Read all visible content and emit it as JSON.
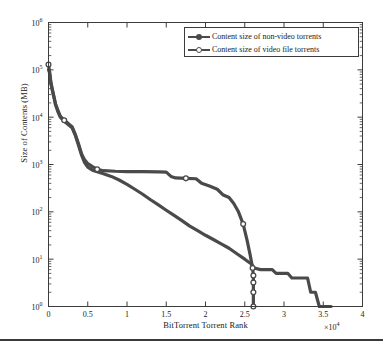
{
  "figure": {
    "background": "#ffffff",
    "line_color": "#4a4a4a",
    "axis_color": "#3c3c3c"
  },
  "legend": {
    "position": "top-right-inside",
    "entries": [
      {
        "label": "Content size of non-video torrents",
        "marker": "filled-dot",
        "series": "non_video"
      },
      {
        "label": "Content size of video file torrents",
        "marker": "open-circle",
        "series": "video"
      }
    ]
  },
  "axes": {
    "x": {
      "title": "BitTorrent Torrent Rank",
      "multiplier": "×10",
      "multiplier_exponent": "4",
      "min": 0,
      "max": 4,
      "ticks": [
        "0",
        "0.5",
        "1",
        "1.5",
        "2",
        "2.5",
        "3",
        "3.5",
        "4"
      ],
      "tick_values": [
        0,
        0.5,
        1,
        1.5,
        2,
        2.5,
        3,
        3.5,
        4
      ],
      "scale": "linear"
    },
    "y": {
      "title": "Size of Contents (MB)",
      "scale": "log",
      "min": 1,
      "max": 1000000,
      "ticks": [
        "10",
        "10",
        "10",
        "10",
        "10",
        "10",
        "10"
      ],
      "tick_exponents": [
        "0",
        "1",
        "2",
        "3",
        "4",
        "5",
        "6"
      ],
      "tick_values": [
        1,
        10,
        100,
        1000,
        10000,
        100000,
        1000000
      ]
    }
  },
  "chart_data": {
    "type": "line",
    "title": "",
    "xlabel": "BitTorrent Torrent Rank",
    "ylabel": "Size of Contents (MB)",
    "xlim": [
      0,
      4
    ],
    "ylim": [
      1,
      1000000
    ],
    "x_multiplier": 10000,
    "y_scale": "log",
    "grid": false,
    "legend_position": "upper right",
    "series": [
      {
        "name": "Content size of non-video torrents",
        "marker": "filled-dot",
        "color": "#4a4a4a",
        "points": [
          [
            0.0,
            100000
          ],
          [
            0.01,
            92000
          ],
          [
            0.02,
            70000
          ],
          [
            0.03,
            52000
          ],
          [
            0.05,
            36000
          ],
          [
            0.07,
            26000
          ],
          [
            0.09,
            18000
          ],
          [
            0.12,
            13000
          ],
          [
            0.15,
            10000
          ],
          [
            0.2,
            8200
          ],
          [
            0.25,
            7000
          ],
          [
            0.3,
            6000
          ],
          [
            0.34,
            4200
          ],
          [
            0.38,
            2600
          ],
          [
            0.42,
            1600
          ],
          [
            0.46,
            1100
          ],
          [
            0.5,
            880
          ],
          [
            0.56,
            760
          ],
          [
            0.62,
            700
          ],
          [
            0.7,
            640
          ],
          [
            0.8,
            560
          ],
          [
            0.9,
            470
          ],
          [
            1.0,
            380
          ],
          [
            1.1,
            300
          ],
          [
            1.2,
            235
          ],
          [
            1.3,
            180
          ],
          [
            1.4,
            140
          ],
          [
            1.5,
            108
          ],
          [
            1.6,
            84
          ],
          [
            1.7,
            65
          ],
          [
            1.8,
            50
          ],
          [
            1.9,
            40
          ],
          [
            2.0,
            32
          ],
          [
            2.1,
            26
          ],
          [
            2.2,
            21
          ],
          [
            2.3,
            17
          ],
          [
            2.4,
            13
          ],
          [
            2.5,
            10
          ],
          [
            2.58,
            8
          ],
          [
            2.62,
            6.5
          ],
          [
            2.7,
            6
          ],
          [
            2.85,
            6
          ],
          [
            2.9,
            5
          ],
          [
            3.05,
            5
          ],
          [
            3.1,
            4
          ],
          [
            3.3,
            4
          ],
          [
            3.34,
            2
          ],
          [
            3.4,
            2
          ],
          [
            3.45,
            1
          ],
          [
            3.6,
            1
          ]
        ]
      },
      {
        "name": "Content size of video file torrents",
        "marker": "open-circle",
        "color": "#4a4a4a",
        "points": [
          [
            0.0,
            130000
          ],
          [
            0.01,
            100000
          ],
          [
            0.02,
            76000
          ],
          [
            0.03,
            56000
          ],
          [
            0.05,
            38000
          ],
          [
            0.07,
            27000
          ],
          [
            0.09,
            19000
          ],
          [
            0.12,
            14000
          ],
          [
            0.15,
            10500
          ],
          [
            0.2,
            8600
          ],
          [
            0.25,
            7400
          ],
          [
            0.3,
            6300
          ],
          [
            0.34,
            4400
          ],
          [
            0.38,
            2800
          ],
          [
            0.42,
            1700
          ],
          [
            0.46,
            1250
          ],
          [
            0.5,
            1050
          ],
          [
            0.56,
            900
          ],
          [
            0.62,
            790
          ],
          [
            0.7,
            740
          ],
          [
            0.85,
            720
          ],
          [
            1.0,
            710
          ],
          [
            1.2,
            705
          ],
          [
            1.4,
            700
          ],
          [
            1.5,
            690
          ],
          [
            1.56,
            560
          ],
          [
            1.62,
            520
          ],
          [
            1.75,
            510
          ],
          [
            1.88,
            500
          ],
          [
            1.95,
            400
          ],
          [
            2.05,
            350
          ],
          [
            2.15,
            300
          ],
          [
            2.22,
            230
          ],
          [
            2.3,
            200
          ],
          [
            2.36,
            150
          ],
          [
            2.42,
            100
          ],
          [
            2.48,
            55
          ],
          [
            2.53,
            25
          ],
          [
            2.57,
            12
          ],
          [
            2.6,
            6.5
          ],
          [
            2.61,
            4.5
          ],
          [
            2.61,
            3.2
          ],
          [
            2.61,
            2.0
          ],
          [
            2.61,
            1.0
          ]
        ]
      }
    ]
  }
}
